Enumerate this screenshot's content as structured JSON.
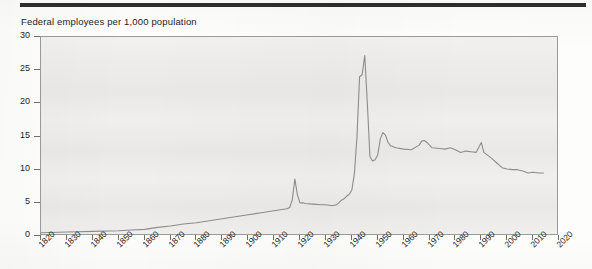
{
  "chart_data": {
    "type": "line",
    "title": "Federal employees per 1,000 population",
    "xlabel": "",
    "ylabel": "",
    "xlim": [
      1820,
      2020
    ],
    "ylim": [
      0,
      30
    ],
    "grid": false,
    "legend": false,
    "y_ticks": [
      0,
      5,
      10,
      15,
      20,
      25,
      30
    ],
    "x_ticks": [
      1820,
      1830,
      1840,
      1850,
      1860,
      1870,
      1880,
      1890,
      1900,
      1910,
      1920,
      1930,
      1940,
      1950,
      1960,
      1970,
      1980,
      1990,
      2000,
      2010,
      2020
    ],
    "line_color": "#8d8d8b",
    "plot_background": "#ecebe9",
    "series": [
      {
        "name": "Federal employees per 1,000 population",
        "x": [
          1820,
          1830,
          1840,
          1850,
          1855,
          1860,
          1865,
          1870,
          1875,
          1880,
          1885,
          1890,
          1895,
          1900,
          1905,
          1910,
          1913,
          1915,
          1916,
          1917,
          1918,
          1919,
          1920,
          1921,
          1922,
          1925,
          1928,
          1930,
          1932,
          1933,
          1934,
          1935,
          1936,
          1937,
          1938,
          1939,
          1940,
          1941,
          1942,
          1943,
          1944,
          1945,
          1946,
          1947,
          1948,
          1949,
          1950,
          1951,
          1952,
          1953,
          1954,
          1955,
          1957,
          1960,
          1963,
          1966,
          1967,
          1968,
          1969,
          1971,
          1974,
          1976,
          1978,
          1980,
          1982,
          1984,
          1986,
          1988,
          1990,
          1991,
          1992,
          1994,
          1996,
          1998,
          2000,
          2002,
          2004,
          2006,
          2008,
          2010,
          2012,
          2014
        ],
        "y": [
          0.5,
          0.6,
          0.7,
          0.8,
          0.9,
          1.0,
          1.3,
          1.5,
          1.8,
          2.0,
          2.3,
          2.6,
          2.9,
          3.2,
          3.5,
          3.8,
          4.0,
          4.1,
          4.3,
          5.4,
          8.6,
          6.2,
          5.0,
          5.0,
          4.9,
          4.8,
          4.7,
          4.7,
          4.6,
          4.6,
          4.7,
          5.0,
          5.4,
          5.6,
          6.0,
          6.3,
          6.9,
          9.4,
          15.0,
          24.0,
          24.3,
          27.2,
          20.0,
          12.0,
          11.3,
          11.5,
          12.2,
          14.6,
          15.6,
          15.2,
          14.1,
          13.6,
          13.3,
          13.1,
          13.0,
          13.7,
          14.3,
          14.4,
          14.1,
          13.3,
          13.2,
          13.1,
          13.3,
          13.0,
          12.6,
          12.8,
          12.7,
          12.6,
          14.1,
          12.6,
          12.3,
          11.7,
          11.0,
          10.3,
          10.1,
          10.0,
          10.0,
          9.8,
          9.5,
          9.6,
          9.5,
          9.5
        ]
      }
    ]
  }
}
